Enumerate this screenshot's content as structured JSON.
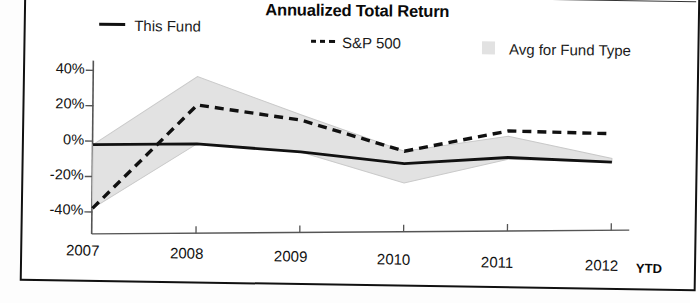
{
  "chart_data": {
    "type": "line",
    "title": "Annualized Total Return",
    "xlabel": "",
    "ylabel": "",
    "x": [
      "2007",
      "2008",
      "2009",
      "2010",
      "2011",
      "2012"
    ],
    "x_axis_note": "YTD",
    "ylim": [
      -40,
      40
    ],
    "yticks": [
      40,
      20,
      0,
      -20,
      -40
    ],
    "ytick_labels": [
      "40%",
      "20%",
      "0%",
      "-20%",
      "-40%"
    ],
    "grid": false,
    "legend_position": "top",
    "series": [
      {
        "name": "This Fund",
        "style": "solid",
        "color": "#111111",
        "values": [
          -2,
          -1,
          -5,
          -11,
          -7,
          -9
        ]
      },
      {
        "name": "S&P 500",
        "style": "dashed",
        "color": "#111111",
        "values": [
          -38,
          21,
          13,
          -4,
          8,
          7
        ]
      },
      {
        "name": "Avg for Fund Type",
        "style": "band",
        "color": "#e2e2e2",
        "band_upper": [
          -2,
          37,
          16,
          -4,
          5,
          -7
        ],
        "band_lower": [
          -38,
          -1,
          -5,
          -22,
          -8,
          -9
        ]
      }
    ]
  },
  "legend": {
    "items": [
      {
        "label": "This Fund",
        "icon": "solid-line-swatch"
      },
      {
        "label": "S&P 500",
        "icon": "dashed-line-swatch"
      },
      {
        "label": "Avg for Fund Type",
        "icon": "shaded-area-swatch"
      }
    ]
  },
  "axis": {
    "y_labels": [
      "40%",
      "20%",
      "0%",
      "-20%",
      "-40%"
    ],
    "x_labels": [
      "2007",
      "2008",
      "2009",
      "2010",
      "2011",
      "2012"
    ],
    "x_suffix": "YTD"
  }
}
